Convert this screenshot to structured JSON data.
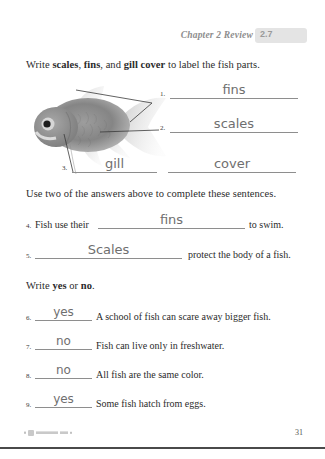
{
  "header": {
    "chapter_review": "Chapter 2 Review",
    "lesson_number": "2.7"
  },
  "sections": {
    "label_instruction_pre": "Write ",
    "label_instruction_b1": "scales",
    "label_instruction_mid1": ", ",
    "label_instruction_b2": "fins",
    "label_instruction_mid2": ", and ",
    "label_instruction_b3": "gill cover",
    "label_instruction_post": " to label the fish parts.",
    "sentence_instruction": "Use two of the answers above to complete these sentences.",
    "yesno_instruction_pre": "Write ",
    "yesno_instruction_b1": "yes",
    "yesno_instruction_mid": " or ",
    "yesno_instruction_b2": "no",
    "yesno_instruction_post": "."
  },
  "fish_labels": [
    {
      "number": "1.",
      "answer": "fins"
    },
    {
      "number": "2.",
      "answer": "scales"
    },
    {
      "number": "3.",
      "answer": "gill",
      "answer2": "cover"
    }
  ],
  "fill_in_questions": [
    {
      "number": "4.",
      "before": "Fish use their",
      "answer": "fins",
      "after": "to swim."
    },
    {
      "number": "5.",
      "before": "",
      "answer": "Scales",
      "after": "protect the body of a fish."
    }
  ],
  "yes_no_questions": [
    {
      "number": "6.",
      "answer": "yes",
      "text": "A school of fish can scare away bigger fish."
    },
    {
      "number": "7.",
      "answer": "no",
      "text": "Fish can live only in freshwater."
    },
    {
      "number": "8.",
      "answer": "no",
      "text": "All fish are the same color."
    },
    {
      "number": "9.",
      "answer": "yes",
      "text": "Some fish hatch from eggs."
    }
  ],
  "footer": {
    "page_number": "31"
  },
  "colors": {
    "ink": "#2b2b2b",
    "handwriting": "#6f6f6f",
    "rule": "#8e8e8e",
    "badge_bg": "#e4e4e4",
    "header_text": "#8d8d8d"
  }
}
